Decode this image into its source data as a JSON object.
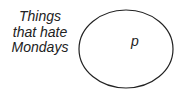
{
  "diagram": {
    "set_label_lines": [
      "Things",
      "that hate",
      "Mondays"
    ],
    "element_label": "p",
    "stroke_color": "#222222"
  }
}
